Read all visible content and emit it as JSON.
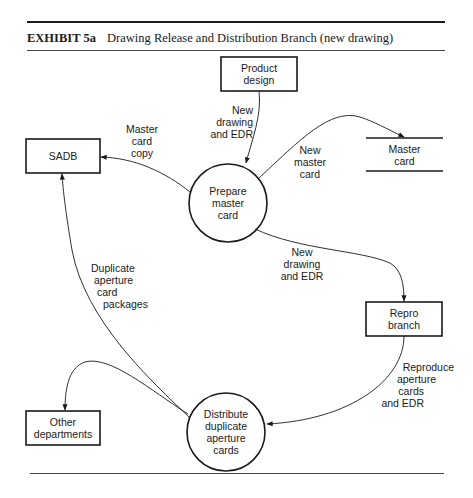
{
  "exhibit": {
    "label": "EXHIBIT 5a",
    "title": "Drawing Release and Distribution Branch (new drawing)"
  },
  "nodes": {
    "product_design": {
      "type": "external-entity",
      "line1": "Product",
      "line2": "design"
    },
    "sadb": {
      "type": "external-entity",
      "line1": "SADB"
    },
    "prepare_master_card": {
      "type": "process",
      "line1": "Prepare",
      "line2": "master",
      "line3": "card"
    },
    "master_card": {
      "type": "data-store",
      "line1": "Master",
      "line2": "card"
    },
    "repro_branch": {
      "type": "external-entity",
      "line1": "Repro",
      "line2": "branch"
    },
    "distribute": {
      "type": "process",
      "line1": "Distribute",
      "line2": "duplicate",
      "line3": "aperture",
      "line4": "cards"
    },
    "other_departments": {
      "type": "external-entity",
      "line1": "Other",
      "line2": "departments"
    }
  },
  "flows": {
    "design_to_prepare": {
      "from": "Product design",
      "to": "Prepare master card",
      "line1": "New",
      "line2": "drawing",
      "line3": "and EDR"
    },
    "prepare_to_sadb": {
      "from": "Prepare master card",
      "to": "SADB",
      "line1": "Master",
      "line2": "card",
      "line3": "copy"
    },
    "prepare_to_store": {
      "from": "Prepare master card",
      "to": "Master card",
      "line1": "New",
      "line2": "master",
      "line3": "card"
    },
    "prepare_to_repro": {
      "from": "Prepare master card",
      "to": "Repro branch",
      "line1": "New",
      "line2": "drawing",
      "line3": "and EDR"
    },
    "repro_to_distribute": {
      "from": "Repro branch",
      "to": "Distribute duplicate aperture cards",
      "line1": "Reproduce",
      "line2": "aperture",
      "line3": "cards",
      "line4": "and EDR"
    },
    "distribute_to_sadb": {
      "from": "Distribute duplicate aperture cards",
      "to": "SADB",
      "line1": "Duplicate",
      "line2": "aperture",
      "line3": "card",
      "line4": "packages"
    },
    "distribute_to_other": {
      "from": "Distribute duplicate aperture cards",
      "to": "Other departments"
    }
  },
  "colors": {
    "ink": "#1a1a1a",
    "background": "#ffffff"
  }
}
